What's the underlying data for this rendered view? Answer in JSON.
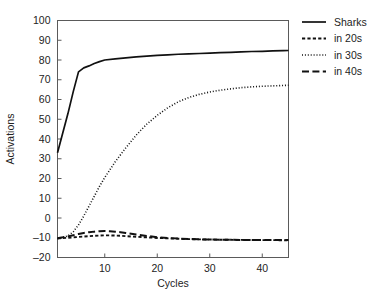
{
  "chart_data": {
    "type": "line",
    "title": "",
    "xlabel": "Cycles",
    "ylabel": "Activations",
    "xlim": [
      1,
      45
    ],
    "ylim": [
      -20,
      100
    ],
    "xticks": [
      10,
      20,
      30,
      40
    ],
    "yticks": [
      -20,
      -10,
      0,
      10,
      20,
      30,
      40,
      50,
      60,
      70,
      80,
      90,
      100
    ],
    "grid": false,
    "legend_position": "right",
    "series": [
      {
        "name": "Sharks",
        "style": "solid",
        "x": [
          1,
          2,
          3,
          4,
          5,
          6,
          7,
          8,
          9,
          10,
          12,
          14,
          16,
          18,
          20,
          22,
          24,
          26,
          28,
          30,
          32,
          34,
          36,
          38,
          40,
          42,
          44,
          45
        ],
        "values": [
          33,
          43,
          53,
          64,
          74,
          76,
          77,
          78.2,
          79.2,
          80,
          80.6,
          81.1,
          81.6,
          82,
          82.3,
          82.6,
          82.9,
          83.1,
          83.3,
          83.5,
          83.7,
          83.9,
          84.1,
          84.3,
          84.4,
          84.6,
          84.7,
          84.8
        ]
      },
      {
        "name": "in 20s",
        "style": "dashed-short",
        "x": [
          1,
          2,
          3,
          4,
          5,
          6,
          7,
          8,
          9,
          10,
          11,
          12,
          13,
          14,
          16,
          18,
          20,
          22,
          24,
          26,
          28,
          30,
          32,
          34,
          36,
          38,
          40,
          42,
          44,
          45
        ],
        "values": [
          -10.3,
          -10.2,
          -10.0,
          -9.8,
          -9.6,
          -9.4,
          -9.2,
          -9.0,
          -8.9,
          -8.8,
          -8.8,
          -8.9,
          -9.0,
          -9.2,
          -9.5,
          -9.8,
          -10.1,
          -10.3,
          -10.5,
          -10.7,
          -10.8,
          -10.9,
          -11.0,
          -11.05,
          -11.1,
          -11.15,
          -11.2,
          -11.2,
          -11.25,
          -11.25
        ]
      },
      {
        "name": "in 30s",
        "style": "dotted",
        "x": [
          1,
          2,
          3,
          4,
          5,
          6,
          7,
          8,
          9,
          10,
          12,
          14,
          16,
          18,
          20,
          22,
          24,
          26,
          28,
          30,
          32,
          34,
          36,
          38,
          40,
          42,
          44,
          45
        ],
        "values": [
          -10.5,
          -10.0,
          -9.0,
          -7.0,
          -3.5,
          1.0,
          6.0,
          11.0,
          16.0,
          20.5,
          28.5,
          35.5,
          42.0,
          47.5,
          52.0,
          55.8,
          58.8,
          61.0,
          62.6,
          63.8,
          64.7,
          65.4,
          66.0,
          66.4,
          66.7,
          66.9,
          67.1,
          67.2
        ]
      },
      {
        "name": "in 40s",
        "style": "dashed-long",
        "x": [
          1,
          2,
          3,
          4,
          5,
          6,
          7,
          8,
          9,
          10,
          11,
          12,
          13,
          14,
          16,
          18,
          20,
          22,
          24,
          26,
          28,
          30,
          32,
          34,
          36,
          38,
          40,
          42,
          44,
          45
        ],
        "values": [
          -10.2,
          -9.8,
          -9.3,
          -8.7,
          -8.1,
          -7.6,
          -7.2,
          -6.9,
          -6.7,
          -6.6,
          -6.7,
          -6.9,
          -7.2,
          -7.6,
          -8.4,
          -9.1,
          -9.7,
          -10.1,
          -10.4,
          -10.6,
          -10.8,
          -10.9,
          -11.0,
          -11.05,
          -11.1,
          -11.15,
          -11.2,
          -11.2,
          -11.2,
          -11.2
        ]
      }
    ]
  },
  "legend": {
    "items": [
      {
        "label": "Sharks",
        "style": "solid"
      },
      {
        "label": "in 20s",
        "style": "dashed-short"
      },
      {
        "label": "in 30s",
        "style": "dotted"
      },
      {
        "label": "in 40s",
        "style": "dashed-long"
      }
    ]
  },
  "axis": {
    "x_title": "Cycles",
    "y_title": "Activations",
    "x_tick_labels": [
      "10",
      "20",
      "30",
      "40"
    ],
    "y_tick_labels": [
      "100",
      "90",
      "80",
      "70",
      "60",
      "50",
      "40",
      "30",
      "20",
      "10",
      "0",
      "–10",
      "–20"
    ]
  },
  "colors": {
    "line": "#111111",
    "frame": "#5a5a5a",
    "text": "#232323",
    "background": "#ffffff"
  }
}
